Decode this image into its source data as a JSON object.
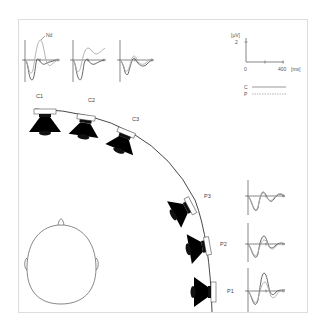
{
  "figure": {
    "annotation_nd": "Nd",
    "scale": {
      "y_unit": "[µV]",
      "y_tick": "2",
      "x_start": "0",
      "x_end": "400",
      "x_unit": "[ms]"
    },
    "legend": {
      "c_label": "C",
      "p_label": "P"
    },
    "speakers": [
      {
        "id": "C1",
        "label": "C1"
      },
      {
        "id": "C2",
        "label": "C2"
      },
      {
        "id": "C3",
        "label": "C3"
      },
      {
        "id": "P3",
        "label": "P3"
      },
      {
        "id": "P2",
        "label": "P2"
      },
      {
        "id": "P1",
        "label": "P1"
      }
    ],
    "colors": {
      "condition_c": "#555555",
      "condition_p": "#aaaaaa",
      "speaker": "#000000",
      "frame": "#dddddd"
    }
  }
}
